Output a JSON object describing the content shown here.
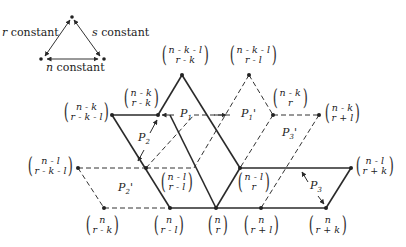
{
  "legend": {
    "r_label": "r",
    "r_text": "constant",
    "s_label": "s",
    "s_text": "constant",
    "n_label": "n",
    "n_text": "constant"
  },
  "nodes": [
    {
      "id": "n-k-l_r-k",
      "top": "n - k - l",
      "bottom": "r - k"
    },
    {
      "id": "n-k-l_r-l",
      "top": "n - k - l",
      "bottom": "r - l"
    },
    {
      "id": "n-k_r-k-l",
      "top": "n - k",
      "bottom": "r - k - l"
    },
    {
      "id": "n-k_r-k",
      "top": "n - k",
      "bottom": "r - k"
    },
    {
      "id": "n-k_r",
      "top": "n - k",
      "bottom": "r"
    },
    {
      "id": "n-k_r+l",
      "top": "n - k",
      "bottom": "r + l"
    },
    {
      "id": "n-l_r-k-l",
      "top": "n - l",
      "bottom": "r - k - l"
    },
    {
      "id": "n-l_r-l",
      "top": "n - l",
      "bottom": "r - l"
    },
    {
      "id": "n-l_r",
      "top": "n - l",
      "bottom": "r"
    },
    {
      "id": "n-l_r+k",
      "top": "n - l",
      "bottom": "r + k"
    },
    {
      "id": "n_r-k",
      "top": "n",
      "bottom": "r - k"
    },
    {
      "id": "n_r-l",
      "top": "n",
      "bottom": "r - l"
    },
    {
      "id": "n_r",
      "top": "n",
      "bottom": "r"
    },
    {
      "id": "n_r+l",
      "top": "n",
      "bottom": "r + l"
    },
    {
      "id": "n_r+k",
      "top": "n",
      "bottom": "r + k"
    }
  ],
  "parallelograms": {
    "P1": {
      "base": "P",
      "sub": "1",
      "prime": ""
    },
    "P1p": {
      "base": "P",
      "sub": "1",
      "prime": "'"
    },
    "P2": {
      "base": "P",
      "sub": "2",
      "prime": ""
    },
    "P2p": {
      "base": "P",
      "sub": "2",
      "prime": "'"
    },
    "P3": {
      "base": "P",
      "sub": "3",
      "prime": ""
    },
    "P3p": {
      "base": "P",
      "sub": "3",
      "prime": "'"
    }
  },
  "colors": {
    "solid_line": "#2a2a2a",
    "dashed_line": "#333333",
    "background": "#ffffff"
  }
}
